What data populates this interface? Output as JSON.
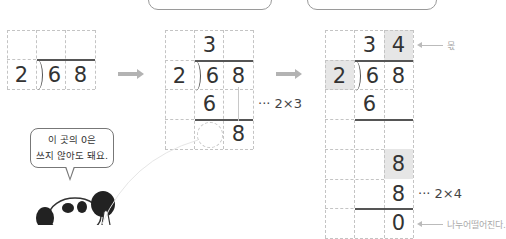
{
  "top_boxes": [
    {
      "label": ""
    },
    {
      "label": ""
    }
  ],
  "step1": {
    "divisor": "2",
    "dividend_digits": [
      "6",
      "8"
    ]
  },
  "step2": {
    "quotient_digits": [
      "3",
      ""
    ],
    "divisor": "2",
    "dividend_digits": [
      "6",
      "8"
    ],
    "product_row": [
      "6",
      ""
    ],
    "product_note": "··· 2×3",
    "bring_down": [
      "",
      "8"
    ]
  },
  "step3": {
    "quotient_digits": [
      "3",
      "4"
    ],
    "divisor": "2",
    "dividend_digits": [
      "6",
      "8"
    ],
    "row3": [
      "6",
      ""
    ],
    "row4": [
      "",
      "8"
    ],
    "row5": [
      "",
      "8"
    ],
    "row6": [
      "",
      "0"
    ],
    "product_note": "··· 2×4",
    "quotient_label": "몫",
    "remainder_label": "나누어떨어진다."
  },
  "speech_bubble": {
    "line1": "이 곳의 0은",
    "line2": "쓰지 않아도 돼요."
  },
  "colors": {
    "shade": "#e6e6e6",
    "grid": "#c4c4c4",
    "arrow": "#b3b3b3"
  }
}
